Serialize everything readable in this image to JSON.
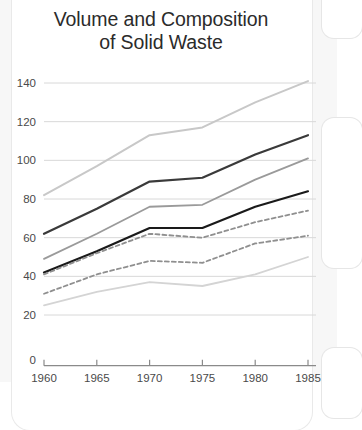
{
  "chart_data": {
    "type": "line",
    "title": "Volume and Composition of Solid Waste",
    "title_line1": "Volume and Composition",
    "title_line2": "of Solid Waste",
    "xlabel": "",
    "ylabel": "",
    "x": [
      1960,
      1965,
      1970,
      1975,
      1980,
      1985
    ],
    "xticklabels": [
      "1960",
      "1965",
      "1970",
      "1975",
      "1980",
      "1985"
    ],
    "yticklabels": [
      "0",
      "20",
      "40",
      "60",
      "80",
      "100",
      "120",
      "140"
    ],
    "yticks": [
      0,
      20,
      40,
      60,
      80,
      100,
      120,
      140
    ],
    "ylim": [
      0,
      148
    ],
    "xlim": [
      1960,
      1985
    ],
    "grid": true,
    "grid_axis": "y",
    "legend": "none",
    "series": [
      {
        "name": "series-1-total",
        "style": "solid",
        "color": "#c8c8c8",
        "width": 2.0,
        "values": [
          82,
          97,
          113,
          117,
          130,
          141
        ]
      },
      {
        "name": "series-2",
        "style": "solid",
        "color": "#3a3a3a",
        "width": 2.2,
        "values": [
          62,
          75,
          89,
          91,
          103,
          113
        ]
      },
      {
        "name": "series-3",
        "style": "solid",
        "color": "#9a9a9a",
        "width": 1.8,
        "values": [
          49,
          62,
          76,
          77,
          90,
          101
        ]
      },
      {
        "name": "series-4",
        "style": "solid",
        "color": "#1a1a1a",
        "width": 2.2,
        "values": [
          42,
          53,
          65,
          65,
          76,
          84
        ]
      },
      {
        "name": "series-5-dashed-upper",
        "style": "dashed",
        "color": "#8f8f8f",
        "width": 1.8,
        "values": [
          41,
          52,
          62,
          60,
          68,
          74
        ]
      },
      {
        "name": "series-6-dashed-lower",
        "style": "dashed",
        "color": "#8f8f8f",
        "width": 1.8,
        "values": [
          31,
          41,
          48,
          47,
          57,
          61
        ]
      },
      {
        "name": "series-7-bottom",
        "style": "solid",
        "color": "#d4d4d4",
        "width": 1.8,
        "values": [
          25,
          32,
          37,
          35,
          41,
          50
        ]
      }
    ]
  },
  "colors": {
    "page_background": "#f7f7f7",
    "card_background": "#ffffff",
    "title_text": "#2b2b2b",
    "tick_text": "#4a4a4a",
    "gridline": "#d8d8d8",
    "axis": "#8a8a8a"
  }
}
